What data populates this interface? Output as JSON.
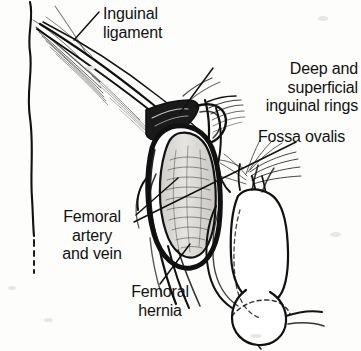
{
  "figure": {
    "type": "anatomical-line-drawing",
    "width": 361,
    "height": 351,
    "background_color": "#fdfdfc",
    "ink_color": "#111111"
  },
  "labels": {
    "inguinal_ligament": "Inguinal\nligament",
    "inguinal_rings": "Deep and\nsuperficial\ninguinal rings",
    "fossa_ovalis": "Fossa ovalis",
    "femoral_vessels": "Femoral\nartery\nand vein",
    "femoral_hernia": "Femoral\nhernia"
  },
  "structures": [
    {
      "name": "body-contour",
      "description": "thin vertical torso outline at left edge"
    },
    {
      "name": "inguinal-ligament-fibers",
      "description": "converging fibrous strands from upper left"
    },
    {
      "name": "inguinal-rings",
      "description": "dark ring structures with spermatic cord"
    },
    {
      "name": "femoral-hernia-sac",
      "description": "large shaded oval sac, center"
    },
    {
      "name": "fossa-ovalis-fibers",
      "description": "fanning fibers right of sac"
    },
    {
      "name": "femoral-vessels",
      "description": "artery and vein passing behind sac"
    },
    {
      "name": "penis-and-scrotum",
      "description": "external genitalia at lower right"
    }
  ]
}
